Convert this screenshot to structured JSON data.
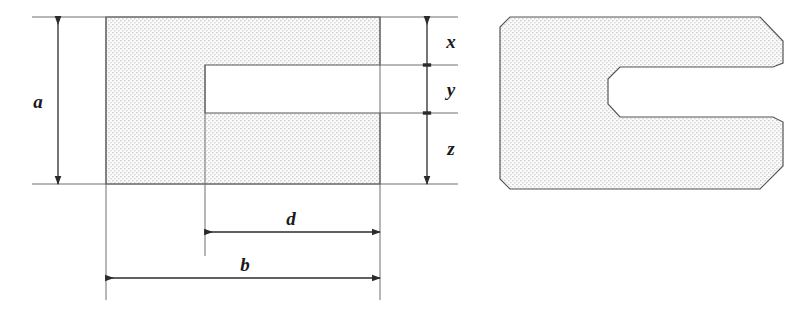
{
  "figure": {
    "title": "",
    "kind": "engineering-dimension-drawing",
    "views": [
      {
        "id": "left",
        "name": "dimensioned-outline-view"
      },
      {
        "id": "right",
        "name": "chamfered-c-shim-view"
      }
    ]
  },
  "colors": {
    "line": "#4d4d4d",
    "dimension_line": "#333333",
    "label_text": "#1a1a1a",
    "hatch_dot": "#c8c8c8",
    "fill": "#fbfbfb",
    "background": "#ffffff"
  },
  "dimensions": {
    "a": {
      "label": "a",
      "orientation": "vertical",
      "meaning": "overall-height"
    },
    "b": {
      "label": "b",
      "orientation": "horizontal",
      "meaning": "overall-length"
    },
    "d": {
      "label": "d",
      "orientation": "horizontal",
      "meaning": "slot-depth"
    },
    "x": {
      "label": "x",
      "orientation": "vertical",
      "meaning": "upper-arm-thickness"
    },
    "y": {
      "label": "y",
      "orientation": "vertical",
      "meaning": "slot-width"
    },
    "z": {
      "label": "z",
      "orientation": "vertical",
      "meaning": "lower-arm-thickness"
    }
  },
  "labels": {
    "a": "a",
    "b": "b",
    "d": "d",
    "x": "x",
    "y": "y",
    "z": "z"
  },
  "geometry": {
    "left_view": {
      "body": {
        "x": 106,
        "y": 17,
        "width": 274,
        "height": 167
      },
      "slot": {
        "x": 205,
        "y": 65,
        "width": 175,
        "height": 48
      }
    },
    "right_view": {
      "body": {
        "x": 500,
        "y": 17,
        "width": 283,
        "height": 172
      },
      "slot": {
        "x": 608,
        "y": 67,
        "width": 175,
        "height": 50
      }
    }
  }
}
